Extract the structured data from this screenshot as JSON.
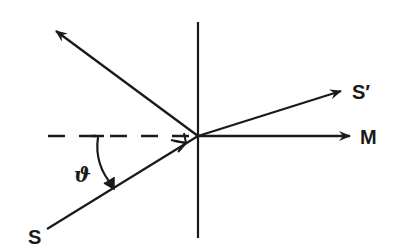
{
  "diagram": {
    "type": "ray-reflection-refraction",
    "colors": {
      "ink": "#1a1a1a",
      "background": "#ffffff"
    },
    "labels": {
      "source": "S",
      "refracted": "S′",
      "normal_direction": "M",
      "angle": "ϑ"
    },
    "elements": [
      {
        "name": "interface-line",
        "style": "solid",
        "orientation": "vertical"
      },
      {
        "name": "normal-dashed-line",
        "style": "dashed",
        "orientation": "horizontal"
      },
      {
        "name": "incident-ray",
        "label": "S",
        "direction": "toward center"
      },
      {
        "name": "reflected-ray",
        "direction": "upper-left"
      },
      {
        "name": "refracted-ray",
        "label": "S′",
        "direction": "upper-right"
      },
      {
        "name": "normal-arrow",
        "label": "M",
        "direction": "right"
      },
      {
        "name": "angle-arc",
        "label": "ϑ"
      }
    ]
  }
}
